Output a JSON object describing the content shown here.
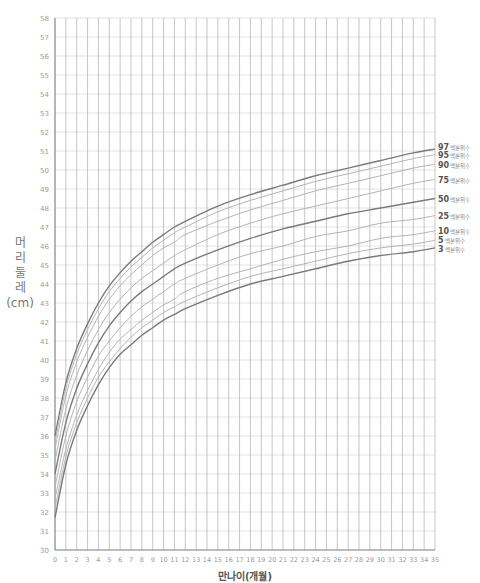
{
  "title": "",
  "y_axis_label": [
    "머",
    "리",
    "둘",
    "레",
    "(cm)"
  ],
  "x_axis_label": "만나이(개월)",
  "chart_data": {
    "type": "line",
    "title": "",
    "xlabel": "만나이(개월)",
    "ylabel": "머리둘레(cm)",
    "xlim": [
      0,
      35
    ],
    "ylim": [
      30,
      58
    ],
    "grid": true,
    "x_ticks": [
      0,
      1,
      2,
      3,
      4,
      5,
      6,
      7,
      8,
      9,
      10,
      11,
      12,
      13,
      14,
      15,
      16,
      17,
      18,
      19,
      20,
      21,
      22,
      23,
      24,
      25,
      26,
      27,
      28,
      29,
      30,
      31,
      32,
      33,
      34,
      35
    ],
    "y_ticks": [
      30,
      31,
      32,
      33,
      34,
      35,
      36,
      37,
      38,
      39,
      40,
      41,
      42,
      43,
      44,
      45,
      46,
      47,
      48,
      49,
      50,
      51,
      52,
      53,
      54,
      55,
      56,
      57,
      58
    ],
    "x": [
      0,
      1,
      2,
      3,
      4,
      5,
      6,
      7,
      8,
      9,
      10,
      11,
      12,
      15,
      18,
      21,
      24,
      27,
      30,
      33,
      35
    ],
    "series": [
      {
        "name": "97",
        "label_suffix": "백분위수",
        "bold": true,
        "values": [
          36.0,
          38.8,
          40.6,
          41.9,
          43.0,
          43.9,
          44.6,
          45.2,
          45.7,
          46.2,
          46.6,
          47.0,
          47.3,
          48.1,
          48.7,
          49.2,
          49.7,
          50.1,
          50.5,
          50.9,
          51.1
        ]
      },
      {
        "name": "95",
        "label_suffix": "백분위수",
        "bold": false,
        "values": [
          35.7,
          38.5,
          40.3,
          41.6,
          42.7,
          43.6,
          44.3,
          44.9,
          45.4,
          45.9,
          46.3,
          46.7,
          47.0,
          47.8,
          48.4,
          48.9,
          49.4,
          49.8,
          50.2,
          50.6,
          50.8
        ]
      },
      {
        "name": "90",
        "label_suffix": "백분위수",
        "bold": false,
        "values": [
          35.3,
          38.1,
          39.9,
          41.2,
          42.3,
          43.2,
          43.9,
          44.5,
          45.0,
          45.5,
          45.9,
          46.2,
          46.6,
          47.3,
          47.9,
          48.4,
          48.9,
          49.3,
          49.7,
          50.1,
          50.3
        ]
      },
      {
        "name": "75",
        "label_suffix": "백분위수",
        "bold": false,
        "values": [
          34.7,
          37.4,
          39.2,
          40.5,
          41.6,
          42.5,
          43.2,
          43.8,
          44.3,
          44.7,
          45.1,
          45.5,
          45.8,
          46.6,
          47.2,
          47.7,
          48.1,
          48.5,
          48.9,
          49.3,
          49.5
        ]
      },
      {
        "name": "50",
        "label_suffix": "백분위수",
        "bold": true,
        "values": [
          34.0,
          36.7,
          38.5,
          39.8,
          40.9,
          41.8,
          42.5,
          43.1,
          43.6,
          44.0,
          44.4,
          44.8,
          45.1,
          45.8,
          46.4,
          46.9,
          47.3,
          47.7,
          48.0,
          48.3,
          48.5
        ]
      },
      {
        "name": "25",
        "label_suffix": "백분위수",
        "bold": false,
        "values": [
          33.3,
          36.0,
          37.8,
          39.1,
          40.2,
          41.0,
          41.7,
          42.3,
          42.8,
          43.2,
          43.6,
          44.0,
          44.3,
          45.0,
          45.6,
          46.0,
          46.5,
          46.8,
          47.2,
          47.4,
          47.6
        ]
      },
      {
        "name": "10",
        "label_suffix": "백분위수",
        "bold": false,
        "values": [
          32.7,
          35.3,
          37.1,
          38.4,
          39.5,
          40.4,
          41.1,
          41.6,
          42.1,
          42.5,
          42.9,
          43.2,
          43.6,
          44.3,
          44.8,
          45.3,
          45.7,
          46.0,
          46.4,
          46.6,
          46.8
        ]
      },
      {
        "name": "5",
        "label_suffix": "백분위수",
        "bold": false,
        "values": [
          32.2,
          34.9,
          36.7,
          38.0,
          39.1,
          39.9,
          40.6,
          41.2,
          41.7,
          42.1,
          42.5,
          42.8,
          43.1,
          43.8,
          44.4,
          44.8,
          45.2,
          45.6,
          45.9,
          46.1,
          46.3
        ]
      },
      {
        "name": "3",
        "label_suffix": "백분위수",
        "bold": true,
        "values": [
          31.7,
          34.5,
          36.3,
          37.6,
          38.7,
          39.6,
          40.3,
          40.8,
          41.3,
          41.7,
          42.1,
          42.4,
          42.7,
          43.4,
          44.0,
          44.4,
          44.8,
          45.2,
          45.5,
          45.7,
          45.9
        ]
      }
    ],
    "legend_position": "right-inline"
  }
}
